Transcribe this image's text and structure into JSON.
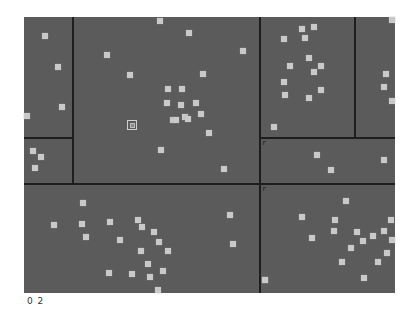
{
  "view": {
    "background_color": "#5b5b5b",
    "point_color": "#c9c9c9",
    "line_color": "#1e1e1e",
    "level_label": "0 2"
  },
  "canvas": {
    "x": 24,
    "y": 17,
    "width": 371,
    "height": 276
  },
  "partition_lines": [
    {
      "orientation": "vertical",
      "x": 73,
      "y1": 17,
      "y2": 184
    },
    {
      "orientation": "horizontal",
      "y": 138,
      "x1": 24,
      "x2": 73
    },
    {
      "orientation": "horizontal",
      "y": 184,
      "x1": 24,
      "x2": 395
    },
    {
      "orientation": "vertical",
      "x": 260,
      "y1": 17,
      "y2": 293
    },
    {
      "orientation": "vertical",
      "x": 355,
      "y1": 17,
      "y2": 138
    },
    {
      "orientation": "horizontal",
      "y": 138,
      "x1": 260,
      "x2": 395
    }
  ],
  "markers": [
    {
      "x": 262,
      "y": 140,
      "glyph": "r"
    },
    {
      "x": 262,
      "y": 186,
      "glyph": "r"
    }
  ],
  "selected_point": {
    "x": 127,
    "y": 120
  },
  "points": [
    [
      42,
      33
    ],
    [
      55,
      64
    ],
    [
      59,
      104
    ],
    [
      24,
      113
    ],
    [
      30,
      148
    ],
    [
      38,
      154
    ],
    [
      32,
      165
    ],
    [
      157,
      18
    ],
    [
      186,
      30
    ],
    [
      127,
      72
    ],
    [
      104,
      52
    ],
    [
      240,
      48
    ],
    [
      200,
      71
    ],
    [
      165,
      86
    ],
    [
      179,
      86
    ],
    [
      164,
      100
    ],
    [
      178,
      102
    ],
    [
      193,
      100
    ],
    [
      198,
      111
    ],
    [
      170,
      117
    ],
    [
      182,
      114
    ],
    [
      185,
      116
    ],
    [
      173,
      117
    ],
    [
      206,
      130
    ],
    [
      158,
      147
    ],
    [
      221,
      166
    ],
    [
      299,
      26
    ],
    [
      311,
      24
    ],
    [
      281,
      36
    ],
    [
      302,
      35
    ],
    [
      306,
      55
    ],
    [
      318,
      63
    ],
    [
      287,
      63
    ],
    [
      311,
      69
    ],
    [
      281,
      79
    ],
    [
      318,
      87
    ],
    [
      282,
      92
    ],
    [
      306,
      95
    ],
    [
      271,
      124
    ],
    [
      383,
      71
    ],
    [
      381,
      84
    ],
    [
      394,
      17
    ],
    [
      395,
      98
    ],
    [
      314,
      152
    ],
    [
      328,
      167
    ],
    [
      381,
      157
    ],
    [
      80,
      200
    ],
    [
      51,
      222
    ],
    [
      79,
      221
    ],
    [
      107,
      219
    ],
    [
      135,
      217
    ],
    [
      83,
      234
    ],
    [
      151,
      229
    ],
    [
      117,
      237
    ],
    [
      139,
      224
    ],
    [
      156,
      239
    ],
    [
      165,
      248
    ],
    [
      138,
      248
    ],
    [
      145,
      261
    ],
    [
      160,
      268
    ],
    [
      147,
      274
    ],
    [
      106,
      270
    ],
    [
      129,
      271
    ],
    [
      155,
      289
    ],
    [
      227,
      212
    ],
    [
      230,
      241
    ],
    [
      299,
      214
    ],
    [
      332,
      217
    ],
    [
      343,
      198
    ],
    [
      331,
      228
    ],
    [
      309,
      235
    ],
    [
      354,
      229
    ],
    [
      348,
      245
    ],
    [
      339,
      259
    ],
    [
      360,
      238
    ],
    [
      370,
      233
    ],
    [
      381,
      228
    ],
    [
      388,
      217
    ],
    [
      390,
      237
    ],
    [
      384,
      250
    ],
    [
      375,
      259
    ],
    [
      361,
      275
    ],
    [
      262,
      277
    ],
    [
      262,
      277
    ]
  ]
}
